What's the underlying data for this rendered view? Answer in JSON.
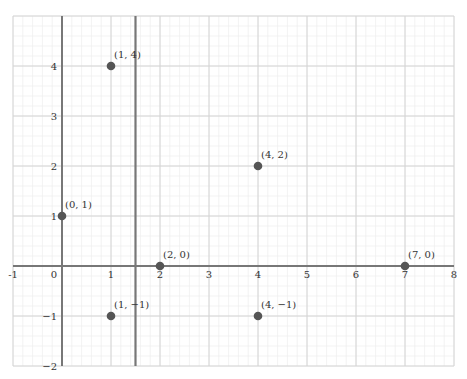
{
  "chart_data": {
    "type": "scatter",
    "title": "",
    "xlabel": "",
    "ylabel": "",
    "xlim": [
      -1,
      8
    ],
    "ylim": [
      -2,
      5
    ],
    "grid": true,
    "minor_grid_subdivisions": 5,
    "x_ticks": [
      -1,
      0,
      1,
      2,
      3,
      4,
      5,
      6,
      7,
      8
    ],
    "x_tick_labels": [
      "-1",
      "0",
      "1",
      "2",
      "3",
      "4",
      "5",
      "6",
      "7",
      "8"
    ],
    "y_ticks": [
      4,
      3,
      2,
      1,
      -1,
      -2
    ],
    "y_tick_labels": [
      "4",
      "3",
      "2",
      "1",
      "−1",
      "−2"
    ],
    "vertical_line": {
      "x": 1.5,
      "color": "#777777"
    },
    "points": [
      {
        "x": 1,
        "y": 4,
        "label": "(1, 4)"
      },
      {
        "x": 4,
        "y": 2,
        "label": "(4, 2)"
      },
      {
        "x": 0,
        "y": 1,
        "label": "(0, 1)"
      },
      {
        "x": 2,
        "y": 0,
        "label": "(2, 0)"
      },
      {
        "x": 7,
        "y": 0,
        "label": "(7, 0)"
      },
      {
        "x": 1,
        "y": -1,
        "label": "(1, −1)"
      },
      {
        "x": 4,
        "y": -1,
        "label": "(4, −1)"
      }
    ],
    "colors": {
      "point": "#555555",
      "axis": "#777777",
      "major_grid": "#d4d4d4",
      "minor_grid": "#eeeeee"
    }
  }
}
